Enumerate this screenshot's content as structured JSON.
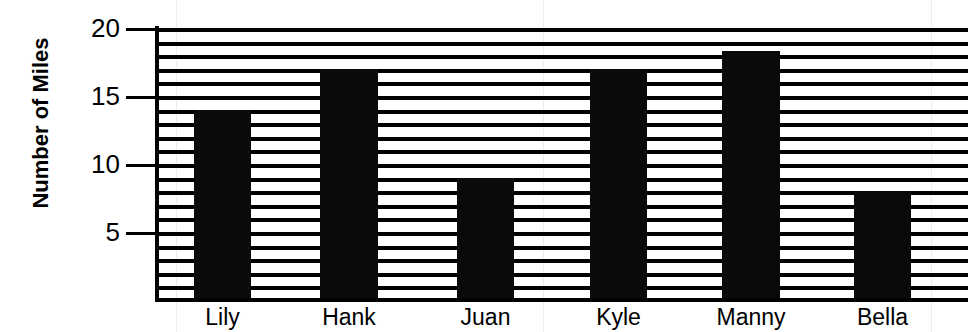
{
  "chart_data": {
    "type": "bar",
    "title": "",
    "xlabel": "",
    "ylabel": "Number of Miles",
    "categories": [
      "Lily",
      "Hank",
      "Juan",
      "Kyle",
      "Manny",
      "Bella"
    ],
    "values": [
      14,
      17,
      9,
      17,
      18.3,
      8
    ],
    "ytick_labels": [
      "20",
      "15",
      "10",
      "5"
    ],
    "ytick_values": [
      20,
      15,
      10,
      5
    ],
    "ylim": [
      0,
      20.3
    ],
    "y_minor_step": 1,
    "grid": "horizontal",
    "legend": "none",
    "bar_color": "#0a0a0a",
    "axis_color": "#000000",
    "background_color": "#ffffff"
  },
  "axis": {
    "y_title": "Number of Miles"
  }
}
